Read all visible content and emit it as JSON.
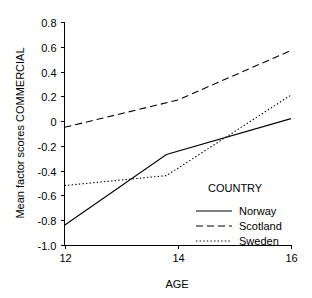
{
  "chart_data": {
    "type": "line",
    "title": "",
    "xlabel": "AGE",
    "ylabel": "Mean factor scores COMMERCIAL",
    "xlim": [
      12,
      16
    ],
    "ylim": [
      -1.0,
      0.8
    ],
    "grid": false,
    "legend_position": "inside-bottom-right",
    "legend_title": "COUNTRY",
    "x_ticks": [
      "12",
      "14",
      "16"
    ],
    "x_tick_values": [
      12,
      14,
      16
    ],
    "y_ticks": [
      "0.8",
      "0.6",
      "0.4",
      "0.2",
      "0",
      "-0.2",
      "-0.4",
      "-0.6",
      "-0.8",
      "-1.0"
    ],
    "y_tick_values": [
      0.8,
      0.6,
      0.4,
      0.2,
      0,
      -0.2,
      -0.4,
      -0.6,
      -0.8,
      -1.0
    ],
    "series": [
      {
        "name": "Norway",
        "style": "solid",
        "color": "#000000",
        "x": [
          12,
          13.8,
          16
        ],
        "values": [
          -0.84,
          -0.27,
          0.02
        ]
      },
      {
        "name": "Scotland",
        "style": "dashed",
        "color": "#000000",
        "x": [
          12,
          14,
          16
        ],
        "values": [
          -0.05,
          0.17,
          0.57
        ]
      },
      {
        "name": "Sweden",
        "style": "dotted",
        "color": "#000000",
        "x": [
          12,
          13.8,
          16
        ],
        "values": [
          -0.52,
          -0.44,
          0.21
        ]
      }
    ]
  },
  "axes": {
    "x_title": "AGE",
    "y_title": "Mean factor scores COMMERCIAL",
    "x_tick_labels": [
      "12",
      "14",
      "16"
    ],
    "y_tick_labels": [
      "0.8",
      "0.6",
      "0.4",
      "0.2",
      "0",
      "-0.2",
      "-0.4",
      "-0.6",
      "-0.8",
      "-1.0"
    ]
  },
  "legend": {
    "title": "COUNTRY",
    "entries": [
      {
        "label": "Norway",
        "style": "solid"
      },
      {
        "label": "Scotland",
        "style": "dashed"
      },
      {
        "label": "Sweden",
        "style": "dotted"
      }
    ]
  }
}
